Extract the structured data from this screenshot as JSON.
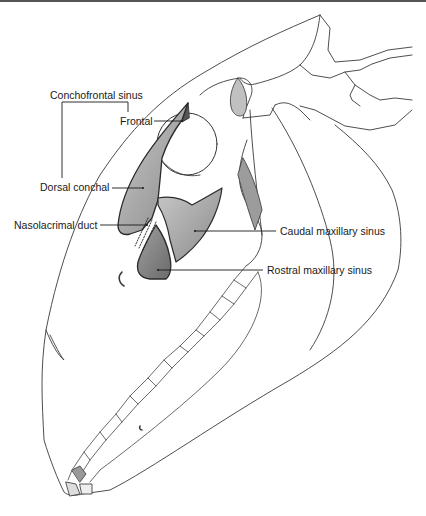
{
  "diagram": {
    "labels": {
      "conchofrontal_sinus": "Conchofrontal sinus",
      "frontal": "Frontal",
      "dorsal_conchal": "Dorsal conchal",
      "nasolacrimal_duct": "Nasolacrimal duct",
      "caudal_maxillary_sinus": "Caudal maxillary sinus",
      "rostral_maxillary_sinus": "Rostral maxillary sinus"
    },
    "colors": {
      "outline": "#3a3a3a",
      "sinus_fill": "#9a9a9a",
      "background": "#ffffff",
      "top_border": "#555555"
    }
  }
}
